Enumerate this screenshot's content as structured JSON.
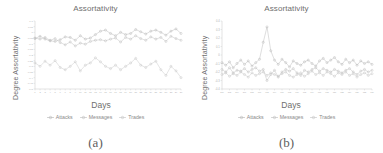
{
  "figure": {
    "panels": [
      {
        "caption": "(a)",
        "title": "Assortativity",
        "xlabel": "Days",
        "ylabel": "Degree Assortativity",
        "legend": [
          {
            "label": "Attacks",
            "color": "#b6b6b6",
            "marker": "circle"
          },
          {
            "label": "Messages",
            "color": "#bdbdbd",
            "marker": "circle"
          },
          {
            "label": "Trades",
            "color": "#c4c4c4",
            "marker": "circle"
          }
        ]
      },
      {
        "caption": "(b)",
        "title": "Assortativity",
        "xlabel": "Days",
        "ylabel": "Degree Assortativity",
        "legend": [
          {
            "label": "Attacks",
            "color": "#b6b6b6",
            "marker": "circle"
          },
          {
            "label": "Messages",
            "color": "#bdbdbd",
            "marker": "circle"
          },
          {
            "label": "Trades",
            "color": "#c4c4c4",
            "marker": "circle"
          }
        ]
      }
    ]
  },
  "chart_data": [
    {
      "type": "line",
      "panel": "(a)",
      "title": "Assortativity",
      "xlabel": "Days",
      "ylabel": "Degree Assortativity",
      "grid": false,
      "legend_position": "bottom",
      "xlim": [
        1,
        30
      ],
      "ylim": [
        -0.5,
        0.1
      ],
      "yticks": [
        0.1,
        0.05,
        0,
        -0.05,
        -0.1,
        -0.15,
        -0.2,
        -0.25,
        -0.3,
        -0.35,
        -0.4,
        -0.45,
        -0.5
      ],
      "ytick_labels": [
        "0.1",
        "0.05",
        "0",
        "-0.05",
        "-0.1",
        "-0.15",
        "-0.2",
        "-0.25",
        "-0.3",
        "-0.35",
        "-0.4",
        "-0.45",
        "-0.5"
      ],
      "x": [
        1,
        2,
        3,
        4,
        5,
        6,
        7,
        8,
        9,
        10,
        11,
        12,
        13,
        14,
        15,
        16,
        17,
        18,
        19,
        20,
        21,
        22,
        23,
        24,
        25,
        26,
        27,
        28,
        29,
        30
      ],
      "xtick_labels": [
        "1",
        "2",
        "3",
        "4",
        "5",
        "6",
        "7",
        "8",
        "9",
        "10",
        "11",
        "12",
        "13",
        "14",
        "15",
        "16",
        "17",
        "18",
        "19",
        "20",
        "21",
        "22",
        "23",
        "24",
        "25",
        "26",
        "27",
        "28",
        "29",
        "30"
      ],
      "series": [
        {
          "name": "Attacks",
          "color": "#b6b6b6",
          "values": [
            -0.055,
            -0.035,
            -0.06,
            -0.075,
            -0.08,
            -0.065,
            -0.04,
            -0.045,
            -0.07,
            -0.03,
            -0.06,
            -0.05,
            -0.02,
            0.01,
            0.02,
            -0.01,
            -0.03,
            0.0,
            -0.02,
            -0.01,
            0.025,
            0.005,
            -0.015,
            0.01,
            0.02,
            0.0,
            -0.025,
            0.01,
            0.03,
            -0.01
          ]
        },
        {
          "name": "Messages",
          "color": "#bdbdbd",
          "values": [
            -0.05,
            -0.06,
            -0.045,
            -0.07,
            -0.055,
            -0.09,
            -0.11,
            -0.085,
            -0.12,
            -0.095,
            -0.105,
            -0.08,
            -0.07,
            -0.065,
            -0.075,
            -0.06,
            -0.05,
            -0.085,
            -0.045,
            -0.06,
            -0.03,
            -0.055,
            -0.07,
            -0.04,
            -0.06,
            -0.045,
            -0.08,
            -0.035,
            -0.055,
            -0.07
          ]
        },
        {
          "name": "Trades",
          "color": "#c4c4c4",
          "values": [
            -0.27,
            -0.3,
            -0.255,
            -0.29,
            -0.25,
            -0.31,
            -0.33,
            -0.3,
            -0.26,
            -0.34,
            -0.29,
            -0.27,
            -0.225,
            -0.26,
            -0.3,
            -0.32,
            -0.29,
            -0.33,
            -0.3,
            -0.27,
            -0.23,
            -0.29,
            -0.31,
            -0.28,
            -0.255,
            -0.33,
            -0.38,
            -0.3,
            -0.34,
            -0.4
          ]
        }
      ]
    },
    {
      "type": "line",
      "panel": "(b)",
      "title": "Assortativity",
      "xlabel": "Days",
      "ylabel": "Degree Assortativity",
      "grid": false,
      "legend_position": "bottom",
      "xlim": [
        290,
        330
      ],
      "ylim": [
        -0.4,
        0.4
      ],
      "yticks": [
        0.4,
        0.3,
        0.2,
        0.1,
        0,
        -0.1,
        -0.2,
        -0.3,
        -0.4
      ],
      "ytick_labels": [
        "0.4",
        "0.3",
        "0.2",
        "0.1",
        "0",
        "-0.1",
        "-0.2",
        "-0.3",
        "-0.4"
      ],
      "x": [
        290,
        291,
        292,
        293,
        294,
        295,
        296,
        297,
        298,
        299,
        300,
        301,
        302,
        303,
        304,
        305,
        306,
        307,
        308,
        309,
        310,
        311,
        312,
        313,
        314,
        315,
        316,
        317,
        318,
        319,
        320,
        321,
        322,
        323,
        324,
        325,
        326,
        327,
        328,
        329,
        330
      ],
      "xtick_labels": [
        "290",
        "292",
        "294",
        "296",
        "298",
        "300",
        "302",
        "304",
        "306",
        "308",
        "310",
        "312",
        "314",
        "316",
        "318",
        "320",
        "322",
        "324",
        "326",
        "328",
        "330"
      ],
      "series": [
        {
          "name": "Attacks",
          "color": "#b6b6b6",
          "values": [
            -0.09,
            -0.12,
            -0.08,
            -0.15,
            -0.1,
            -0.06,
            -0.11,
            -0.07,
            -0.13,
            -0.09,
            -0.05,
            0.15,
            0.33,
            0.05,
            -0.06,
            -0.11,
            -0.05,
            -0.09,
            -0.14,
            -0.07,
            -0.1,
            -0.12,
            -0.08,
            -0.06,
            -0.1,
            -0.13,
            -0.07,
            -0.04,
            -0.09,
            -0.06,
            -0.03,
            -0.08,
            -0.11,
            -0.05,
            -0.09,
            -0.06,
            -0.12,
            -0.07,
            -0.1,
            -0.08,
            -0.11
          ]
        },
        {
          "name": "Messages",
          "color": "#bdbdbd",
          "values": [
            -0.17,
            -0.2,
            -0.15,
            -0.21,
            -0.18,
            -0.19,
            -0.16,
            -0.2,
            -0.17,
            -0.15,
            -0.19,
            -0.17,
            -0.3,
            -0.23,
            -0.18,
            -0.26,
            -0.2,
            -0.17,
            -0.19,
            -0.16,
            -0.21,
            -0.24,
            -0.18,
            -0.2,
            -0.17,
            -0.15,
            -0.19,
            -0.16,
            -0.18,
            -0.2,
            -0.17,
            -0.19,
            -0.21,
            -0.18,
            -0.16,
            -0.2,
            -0.23,
            -0.19,
            -0.17,
            -0.2,
            -0.18
          ]
        },
        {
          "name": "Trades",
          "color": "#c4c4c4",
          "values": [
            -0.23,
            -0.21,
            -0.25,
            -0.22,
            -0.24,
            -0.2,
            -0.23,
            -0.26,
            -0.21,
            -0.24,
            -0.22,
            -0.2,
            -0.24,
            -0.21,
            -0.23,
            -0.25,
            -0.22,
            -0.2,
            -0.24,
            -0.26,
            -0.23,
            -0.21,
            -0.25,
            -0.22,
            -0.19,
            -0.23,
            -0.21,
            -0.24,
            -0.2,
            -0.22,
            -0.25,
            -0.21,
            -0.23,
            -0.2,
            -0.24,
            -0.22,
            -0.26,
            -0.23,
            -0.21,
            -0.24,
            -0.22
          ]
        }
      ]
    }
  ]
}
